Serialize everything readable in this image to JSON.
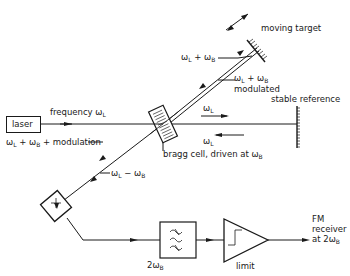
{
  "diagram": {
    "type": "laser doppler vibrometer / optical heterodyne setup",
    "components": {
      "laser": "laser",
      "bragg_cell": "bragg cell, driven at ω",
      "bragg_cell_sub": "B",
      "moving_target": "moving target",
      "stable_reference": "stable reference",
      "filter_label": "2ω",
      "filter_label_sub": "B",
      "limiter": "limit",
      "receiver_line1": "FM",
      "receiver_line2": "receiver",
      "receiver_line3": "at 2ω",
      "receiver_sub": "B"
    },
    "beams": {
      "frequency": "frequency ω",
      "frequency_sub": "L",
      "to_target": "ω",
      "to_target_sub1": "L",
      "to_target_mid": " + ω",
      "to_target_sub2": "B",
      "from_target": "ω",
      "from_target_sub1": "L",
      "from_target_mid": " + ω",
      "from_target_sub2": "B",
      "from_target_line2": "modulated",
      "ref_out": "ω",
      "ref_out_sub": "L",
      "ref_back": "ω",
      "ref_back_sub": "L",
      "return_mod": "ω",
      "return_mod_sub1": "L",
      "return_mod_mid": " + ω",
      "return_mod_sub2": "B",
      "return_mod_tail": " + modulation",
      "diff": "ω",
      "diff_sub1": "L",
      "diff_mid": " − ω",
      "diff_sub2": "B"
    }
  }
}
